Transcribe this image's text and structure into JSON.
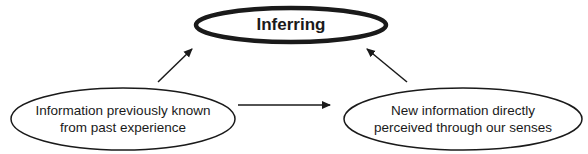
{
  "diagram": {
    "top_node": {
      "label": "Inferring"
    },
    "left_node": {
      "line1": "Information previously known",
      "line2": "from past experience"
    },
    "right_node": {
      "line1": "New information directly",
      "line2": "perceived through our senses"
    },
    "edges": [
      {
        "from": "left_node",
        "to": "top_node"
      },
      {
        "from": "right_node",
        "to": "top_node"
      },
      {
        "from": "left_node",
        "to": "right_node"
      }
    ],
    "colors": {
      "stroke": "#1a1a1a",
      "background": "#ffffff"
    }
  }
}
